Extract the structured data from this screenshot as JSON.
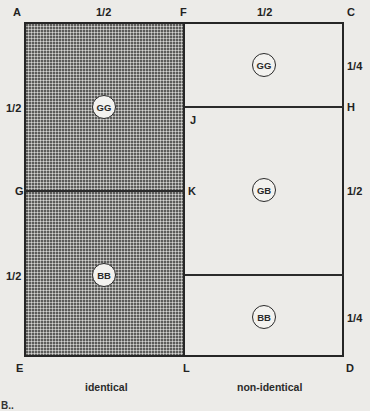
{
  "diagram": {
    "points": {
      "A": "A",
      "F": "F",
      "C": "C",
      "J": "J",
      "H": "H",
      "G": "G",
      "K": "K",
      "E": "E",
      "L": "L",
      "D": "D"
    },
    "fractions": {
      "top_left": "1/2",
      "top_right": "1/2",
      "left_upper": "1/2",
      "left_lower": "1/2",
      "right_top": "1/4",
      "right_middle": "1/2",
      "right_bottom": "1/4"
    },
    "regions": {
      "identical_upper": "GG",
      "identical_lower": "BB",
      "nonidentical_top": "GG",
      "nonidentical_middle": "GB",
      "nonidentical_bottom": "BB"
    },
    "captions": {
      "left": "identical",
      "right": "non-identical"
    },
    "cropped_label": "B..",
    "colors": {
      "background": "#ecebe8",
      "shading": "#a9a9a7",
      "lines": "#262626"
    }
  }
}
